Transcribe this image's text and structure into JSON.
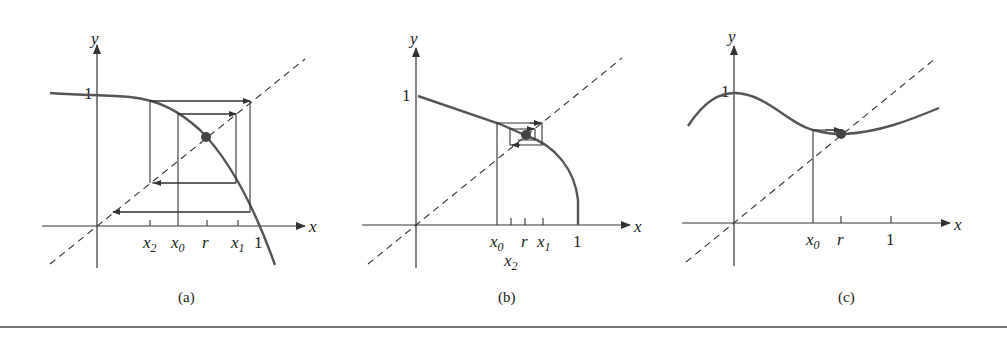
{
  "figure": {
    "panels": [
      {
        "id": "a",
        "caption": "(a)",
        "axis_x": "x",
        "axis_y": "y",
        "y_tick_label": "1",
        "x_tick_labels": [
          {
            "base": "x",
            "sub": "2"
          },
          {
            "base": "x",
            "sub": "0"
          },
          {
            "base": "r",
            "sub": ""
          },
          {
            "base": "x",
            "sub": "1"
          },
          {
            "base": "1",
            "sub": ""
          }
        ],
        "description": "Iterates spiral outward from fixed point r (diverging)"
      },
      {
        "id": "b",
        "caption": "(b)",
        "axis_x": "x",
        "axis_y": "y",
        "y_tick_label": "1",
        "x_tick_labels": [
          {
            "base": "x",
            "sub": "0"
          },
          {
            "base": "r",
            "sub": ""
          },
          {
            "base": "x",
            "sub": "1"
          },
          {
            "base": "1",
            "sub": ""
          },
          {
            "base": "x",
            "sub": "2"
          }
        ],
        "description": "Iterates spiral inward to fixed point r (converging)"
      },
      {
        "id": "c",
        "caption": "(c)",
        "axis_x": "x",
        "axis_y": "y",
        "y_tick_label": "1",
        "x_tick_labels": [
          {
            "base": "x",
            "sub": "0"
          },
          {
            "base": "r",
            "sub": ""
          },
          {
            "base": "1",
            "sub": ""
          }
        ],
        "description": "Iterates converge monotonically to fixed point r"
      }
    ],
    "colors": {
      "curve": "#555555",
      "axes": "#333333",
      "fixed_point": "#444444"
    }
  }
}
